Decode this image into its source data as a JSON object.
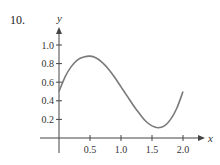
{
  "problem_number": "10.",
  "chart_data": {
    "type": "line",
    "title": "",
    "xlabel": "x",
    "ylabel": "y",
    "xlim": [
      0,
      2.0
    ],
    "ylim": [
      0,
      1.0
    ],
    "x_ticks": [
      "0.5",
      "1.0",
      "1.5",
      "2.0"
    ],
    "y_ticks": [
      "0.2",
      "0.4",
      "0.6",
      "0.8",
      "1.0"
    ],
    "grid": false,
    "series": [
      {
        "name": "f(x)",
        "x": [
          0,
          0.1,
          0.2,
          0.3,
          0.4,
          0.5,
          0.6,
          0.7,
          0.8,
          0.9,
          1.0,
          1.1,
          1.2,
          1.3,
          1.4,
          1.5,
          1.6,
          1.7,
          1.8,
          1.9,
          2.0
        ],
        "values": [
          0.5,
          0.66,
          0.77,
          0.84,
          0.87,
          0.88,
          0.86,
          0.81,
          0.74,
          0.65,
          0.55,
          0.45,
          0.35,
          0.26,
          0.18,
          0.13,
          0.11,
          0.13,
          0.2,
          0.32,
          0.5
        ]
      }
    ],
    "colors": {
      "curve": "#7a7a7a",
      "axis": "#444444"
    }
  }
}
